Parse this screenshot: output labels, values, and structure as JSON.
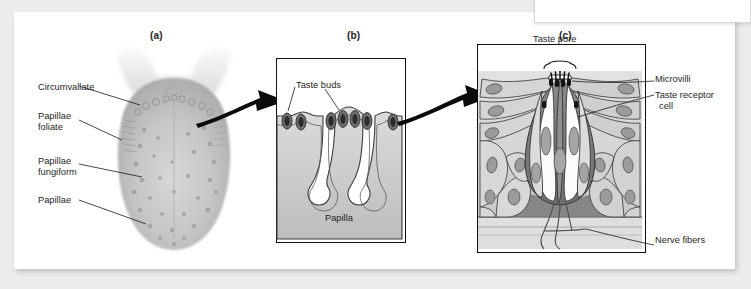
{
  "figure": {
    "title_caption_a": "(a)",
    "title_caption_b": "(b)",
    "title_caption_c": "(c)",
    "background_color": "#ececec",
    "card_color": "#ffffff",
    "ink_color": "#1b1b1b"
  },
  "panel_a": {
    "caption": "(a)",
    "subject": "tongue-dorsal-surface-photo",
    "labels": [
      {
        "id": "circumvallate",
        "text": "Circumvallate"
      },
      {
        "id": "papillae-foliate",
        "line1": "Papillae",
        "line2": "foliate"
      },
      {
        "id": "papillae-fungiform",
        "line1": "Papillae",
        "line2": "fungiform"
      },
      {
        "id": "papillae",
        "text": "Papillae"
      }
    ]
  },
  "panel_b": {
    "caption": "(b)",
    "subject": "papilla-cross-section",
    "labels": [
      {
        "id": "taste-buds",
        "text": "Taste buds"
      },
      {
        "id": "papilla",
        "text": "Papilla"
      }
    ]
  },
  "panel_c": {
    "caption": "(c)",
    "subject": "taste-bud-cellular-detail",
    "labels": [
      {
        "id": "taste-pore",
        "text": "Taste pore"
      },
      {
        "id": "microvilli",
        "text": "Microvilli"
      },
      {
        "id": "taste-receptor-cell",
        "line1": "Taste receptor",
        "line2": "cell"
      },
      {
        "id": "nerve-fibers",
        "text": "Nerve fibers"
      }
    ]
  },
  "arrows": [
    {
      "id": "arrow-a-to-b",
      "direction": "right"
    },
    {
      "id": "arrow-b-to-c",
      "direction": "right"
    }
  ]
}
